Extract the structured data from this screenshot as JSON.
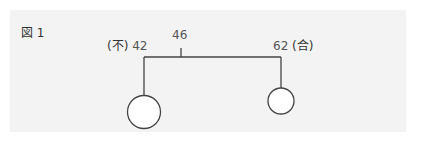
{
  "figure": {
    "label": "図 1",
    "left_label_prefix": "(不)",
    "left_value": "42",
    "center_value": "46",
    "right_value": "62",
    "right_label_suffix": "(合)"
  },
  "colors": {
    "panel_bg": "#f3f3f3",
    "line": "#444444",
    "number_text": "#666666"
  }
}
